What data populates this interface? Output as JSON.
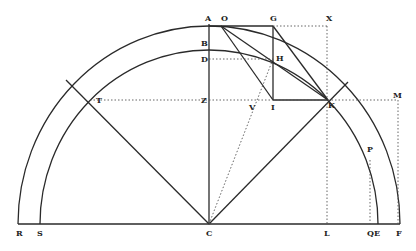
{
  "diagram": {
    "labels": {
      "A": "A",
      "O": "O",
      "G": "G",
      "X": "X",
      "B": "B",
      "D": "D",
      "H": "H",
      "Z": "Z",
      "V": "V",
      "I": "I",
      "K": "K",
      "M": "M",
      "T": "T",
      "P": "P",
      "R": "R",
      "S": "S",
      "C": "C",
      "L": "L",
      "Q": "Q",
      "E": "E",
      "F": "F"
    },
    "ink_color": "#2a2a2a"
  }
}
